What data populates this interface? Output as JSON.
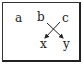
{
  "diagram": {
    "nodes": [
      {
        "id": "a",
        "label": "a"
      },
      {
        "id": "b",
        "label": "b"
      },
      {
        "id": "c",
        "label": "c"
      },
      {
        "id": "x",
        "label": "x"
      },
      {
        "id": "y",
        "label": "y"
      }
    ],
    "edges": [
      {
        "from": "b",
        "to": "y"
      },
      {
        "from": "c",
        "to": "x"
      }
    ],
    "colors": {
      "stroke": "#222222",
      "background": "#ffffff"
    }
  }
}
